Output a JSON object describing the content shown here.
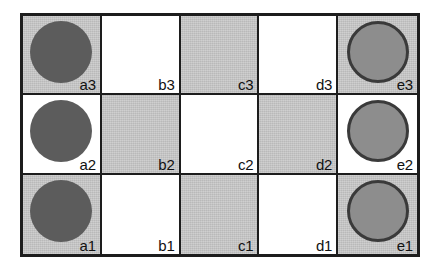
{
  "figure": {
    "kind": "grid-board-diagram",
    "columns": [
      "a",
      "b",
      "c",
      "d",
      "e"
    ],
    "rows": [
      "3",
      "2",
      "1"
    ],
    "colors": {
      "border": "#1d1d1d",
      "cell_white": "#ffffff",
      "cell_gray": "#c6c6c6",
      "disc_dark_fill": "#5c5c5c",
      "disc_light_fill": "#8d8d8d",
      "disc_light_outline": "#3a3a3a",
      "label_text": "#111111"
    }
  },
  "board": {
    "cells": [
      {
        "label": "a3",
        "shade": "gray",
        "piece": "dark-disc"
      },
      {
        "label": "b3",
        "shade": "white",
        "piece": "none"
      },
      {
        "label": "c3",
        "shade": "gray",
        "piece": "none"
      },
      {
        "label": "d3",
        "shade": "white",
        "piece": "none"
      },
      {
        "label": "e3",
        "shade": "gray",
        "piece": "light-disc"
      },
      {
        "label": "a2",
        "shade": "white",
        "piece": "dark-disc"
      },
      {
        "label": "b2",
        "shade": "gray",
        "piece": "none"
      },
      {
        "label": "c2",
        "shade": "white",
        "piece": "none"
      },
      {
        "label": "d2",
        "shade": "gray",
        "piece": "none"
      },
      {
        "label": "e2",
        "shade": "white",
        "piece": "light-disc"
      },
      {
        "label": "a1",
        "shade": "gray",
        "piece": "dark-disc"
      },
      {
        "label": "b1",
        "shade": "white",
        "piece": "none"
      },
      {
        "label": "c1",
        "shade": "gray",
        "piece": "none"
      },
      {
        "label": "d1",
        "shade": "white",
        "piece": "none"
      },
      {
        "label": "e1",
        "shade": "gray",
        "piece": "light-disc"
      }
    ]
  }
}
